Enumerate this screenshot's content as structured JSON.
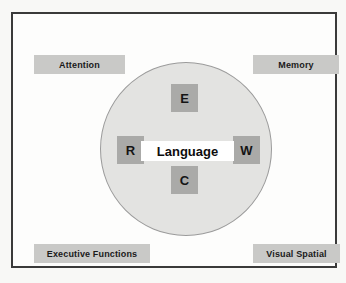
{
  "diagram": {
    "colors": {
      "page_background": "#f8f8f6",
      "frame_background": "#fdfdfc",
      "frame_border": "#3a3a3a",
      "circle_fill": "#e3e3e1",
      "circle_border": "#9b9b9b",
      "domain_label_fill": "#c9c9c7",
      "letter_tile_fill": "#aaaaa8",
      "core_fill": "#ffffff",
      "text": "#141414"
    },
    "circle": {
      "name": "language-circle",
      "center_x": 173,
      "center_y": 135,
      "radius": 86
    },
    "core": {
      "label": "Language"
    },
    "letter_tiles": [
      {
        "id": "e",
        "label": "E",
        "position": "top"
      },
      {
        "id": "r",
        "label": "R",
        "position": "left"
      },
      {
        "id": "w",
        "label": "W",
        "position": "right"
      },
      {
        "id": "c",
        "label": "C",
        "position": "bottom"
      }
    ],
    "domain_labels": [
      {
        "id": "attention",
        "label": "Attention",
        "corner": "top-left"
      },
      {
        "id": "memory",
        "label": "Memory",
        "corner": "top-right"
      },
      {
        "id": "executive-functions",
        "label": "Executive Functions",
        "corner": "bottom-left"
      },
      {
        "id": "visual-spatial",
        "label": "Visual Spatial",
        "corner": "bottom-right"
      }
    ]
  }
}
